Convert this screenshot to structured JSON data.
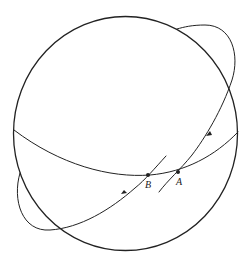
{
  "figure": {
    "colors": {
      "stroke": "#222222",
      "background": "#ffffff"
    },
    "points": [
      {
        "id": "B",
        "label": "B",
        "x": 148,
        "y": 175
      },
      {
        "id": "A",
        "label": "A",
        "x": 178,
        "y": 172
      }
    ],
    "labels": {
      "point_b": "B",
      "point_a": "A"
    }
  }
}
